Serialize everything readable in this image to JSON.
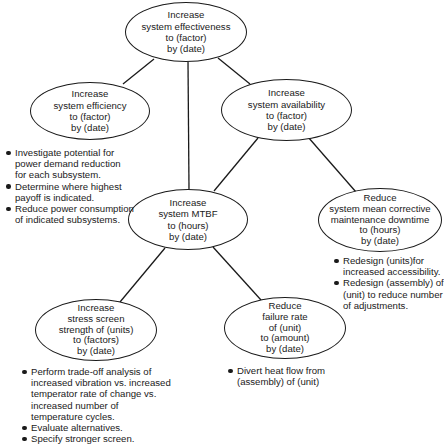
{
  "diagram": {
    "type": "goal-tree",
    "nodes": {
      "root": {
        "lines": [
          "Increase",
          "system effectiveness",
          "to (factor)",
          "by (date)"
        ]
      },
      "efficiency": {
        "lines": [
          "Increase",
          "system efficiency",
          "to (factor)",
          "by (date)"
        ]
      },
      "availability": {
        "lines": [
          "Increase",
          "system availability",
          "to (factor)",
          "by (date)"
        ]
      },
      "mtbf": {
        "lines": [
          "Increase",
          "system MTBF",
          "to (hours)",
          "by (date)"
        ]
      },
      "downtime": {
        "lines": [
          "Reduce",
          "system mean corrective",
          "maintenance downtime",
          "to (hours)",
          "by (date)"
        ]
      },
      "stress": {
        "lines": [
          "Increase",
          "stress screen",
          "strength of (units)",
          "to (factors)",
          "by (date)"
        ]
      },
      "failure": {
        "lines": [
          "Reduce",
          "failure rate",
          "of (unit)",
          "to (amount)",
          "by (date)"
        ]
      }
    },
    "edges": [
      [
        "root",
        "efficiency"
      ],
      [
        "root",
        "mtbf"
      ],
      [
        "root",
        "availability"
      ],
      [
        "availability",
        "mtbf"
      ],
      [
        "availability",
        "downtime"
      ],
      [
        "mtbf",
        "stress"
      ],
      [
        "mtbf",
        "failure"
      ]
    ],
    "notes": {
      "efficiency": [
        {
          "lines": [
            "Investigate potential for",
            "power demand reduction",
            "for each subsystem."
          ]
        },
        {
          "lines": [
            "Determine where highest",
            "payoff is indicated."
          ]
        },
        {
          "lines": [
            "Reduce power consumption",
            "of indicated subsystems."
          ]
        }
      ],
      "downtime": [
        {
          "lines": [
            "Redesign (units)for",
            "increased accessibility."
          ]
        },
        {
          "lines": [
            "Redesign (assembly) of",
            "(unit) to reduce number",
            "of adjustments."
          ]
        }
      ],
      "stress": [
        {
          "lines": [
            "Perform trade-off analysis of",
            "increased vibration vs. increased",
            "temperator rate of change vs.",
            "increased number of",
            "temperature cycles."
          ]
        },
        {
          "lines": [
            "Evaluate alternatives."
          ]
        },
        {
          "lines": [
            "Specify stronger screen."
          ]
        }
      ],
      "failure": [
        {
          "lines": [
            "Divert heat flow from",
            "(assembly) of (unit)"
          ]
        }
      ]
    },
    "colors": {
      "ink": "#1a1a1a",
      "background": "#ffffff"
    }
  }
}
